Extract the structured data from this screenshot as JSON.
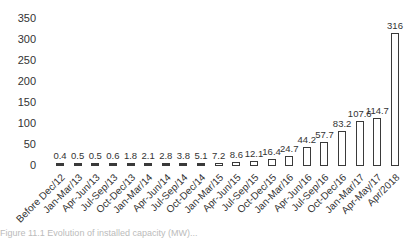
{
  "chart_data": {
    "type": "bar",
    "title": "",
    "xlabel": "",
    "ylabel": "",
    "ylim": [
      0,
      350
    ],
    "yticks": [
      0,
      50,
      100,
      150,
      200,
      250,
      300,
      350
    ],
    "grid": false,
    "legend": null,
    "categories": [
      "Before Dec/12",
      "Jan-Mar/13",
      "Apr-Jun/13",
      "Jul-Sep/13",
      "Oct-Dec/13",
      "Jan-Mar/14",
      "Apr-Jun/14",
      "Jul-Sep/14",
      "Oct-Dec/14",
      "Jan-Mar/15",
      "Apr-Jun/15",
      "Jul-Sep/15",
      "Oct-Dec/15",
      "Jan-Mar/16",
      "Apr-Jun/16",
      "Jul-Sep/16",
      "Oct-Dec/16",
      "Jan-Mar/17",
      "Apr-May/17",
      "Apr/2018"
    ],
    "values": [
      0.4,
      0.5,
      0.5,
      0.6,
      1.8,
      2.1,
      2.8,
      3.8,
      5.1,
      7.2,
      8.6,
      12.1,
      16.4,
      24.7,
      44.2,
      57.7,
      83.2,
      107.6,
      114.7,
      316
    ],
    "value_labels": [
      "0.4",
      "0.5",
      "0.5",
      "0.6",
      "1.8",
      "2.1",
      "2.8",
      "3.8",
      "5.1",
      "7.2",
      "8.6",
      "12.1",
      "16.4",
      "24.7",
      "44.2",
      "57.7",
      "83.2",
      "107.6",
      "114.7",
      "316"
    ],
    "bar_style": {
      "fill": "#ffffff",
      "stroke": "#3a3a3a"
    }
  },
  "caption": "Figure 11.1 Evolution of installed capacity (MW)..."
}
